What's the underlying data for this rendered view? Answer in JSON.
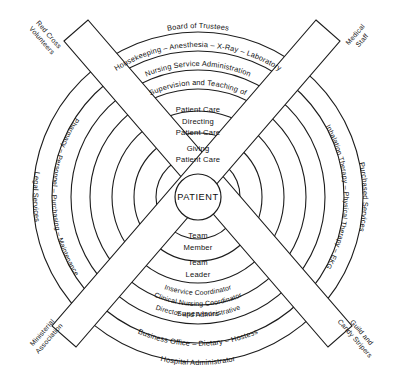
{
  "diagram": {
    "center": {
      "label": "PATIENT"
    },
    "colors": {
      "stroke": "#1c1c1c",
      "background": "#ffffff",
      "text": "#111111"
    },
    "rings_top": [
      {
        "id": "ring7-top",
        "label": "Board of Trustees"
      },
      {
        "id": "ring6-top",
        "label": "Housekeeping – Anesthesia – X-Ray – Laboratory"
      },
      {
        "id": "ring5-top",
        "label": "Nursing Service Administration"
      },
      {
        "id": "ring4-top",
        "label": "Supervision and Teaching of"
      },
      {
        "id": "ring4-top-line2",
        "label": "Patient Care"
      },
      {
        "id": "ring3-top",
        "label": "Directing"
      },
      {
        "id": "ring3-top-line2",
        "label": "Patient Care"
      },
      {
        "id": "ring2-top",
        "label": "Giving"
      },
      {
        "id": "ring2-top-line2",
        "label": "Patient Care"
      }
    ],
    "rings_bottom": [
      {
        "id": "ring2-bottom",
        "label": "Team"
      },
      {
        "id": "ring2-bottom-line2",
        "label": "Member"
      },
      {
        "id": "ring3-bottom",
        "label": "Team"
      },
      {
        "id": "ring3-bottom-line2",
        "label": "Leader"
      },
      {
        "id": "ring4-bottom",
        "label": "Inservice Coordinator"
      },
      {
        "id": "ring4-bottom-line2",
        "label": "Clinical Nursing Coordinator"
      },
      {
        "id": "ring5-bottom",
        "label": "Director and Administrative"
      },
      {
        "id": "ring5-bottom-line2",
        "label": "Supervisors"
      },
      {
        "id": "ring6-bottom",
        "label": "Business Office – Dietary – Hostess"
      },
      {
        "id": "ring7-bottom",
        "label": "Hospital Administrator"
      }
    ],
    "rings_left": [
      {
        "id": "ring7-left",
        "label": "Legal Services"
      },
      {
        "id": "ring6-left",
        "label": "Pharmacy – Personnel – Purchasing – Maintenance"
      }
    ],
    "rings_right": [
      {
        "id": "ring7-right",
        "label": "Purchased Services"
      },
      {
        "id": "ring6-right",
        "label": "Inhalation Therapy – Physical Therapy – EKG"
      }
    ],
    "corner_bars": [
      {
        "id": "corner-top-left",
        "line1": "Red Cross",
        "line2": "Volunteers"
      },
      {
        "id": "corner-top-right",
        "line1": "Medical",
        "line2": "Staff"
      },
      {
        "id": "corner-bottom-left",
        "line1": "Ministerial",
        "line2": "Association"
      },
      {
        "id": "corner-bottom-right",
        "line1": "Guild and",
        "line2": "Candy Stripers"
      }
    ]
  }
}
